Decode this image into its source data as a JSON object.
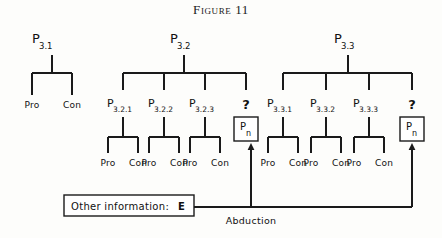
{
  "figure": {
    "title": "Figure 11",
    "background_color": "#fdfdfb",
    "line_color": "#1a1a1a"
  },
  "trees": [
    {
      "id": "tree-3-1",
      "root_label": "P",
      "root_subscript": "3.1",
      "children": [
        {
          "label": "Pro"
        },
        {
          "label": "Con"
        }
      ]
    },
    {
      "id": "tree-3-2",
      "root_label": "P",
      "root_subscript": "3.2",
      "children": [
        {
          "label": "P",
          "subscript": "3.2.1",
          "leaves": [
            "Pro",
            "Con"
          ]
        },
        {
          "label": "P",
          "subscript": "3.2.2",
          "leaves": [
            "Pro",
            "Con"
          ]
        },
        {
          "label": "P",
          "subscript": "3.2.3",
          "leaves": [
            "Pro",
            "Con"
          ]
        },
        {
          "label": "?",
          "box": {
            "label": "P",
            "subscript": "n"
          }
        }
      ]
    },
    {
      "id": "tree-3-3",
      "root_label": "P",
      "root_subscript": "3.3",
      "children": [
        {
          "label": "P",
          "subscript": "3.3.1",
          "leaves": [
            "Pro",
            "Con"
          ]
        },
        {
          "label": "P",
          "subscript": "3.3.2",
          "leaves": [
            "Pro",
            "Con"
          ]
        },
        {
          "label": "P",
          "subscript": "3.3.3",
          "leaves": [
            "Pro",
            "Con"
          ]
        },
        {
          "label": "?",
          "box": {
            "label": "P",
            "subscript": "n"
          }
        }
      ]
    }
  ],
  "evidence_box": {
    "text": "Other information:",
    "symbol": "E"
  },
  "connector": {
    "label": "Abduction"
  }
}
